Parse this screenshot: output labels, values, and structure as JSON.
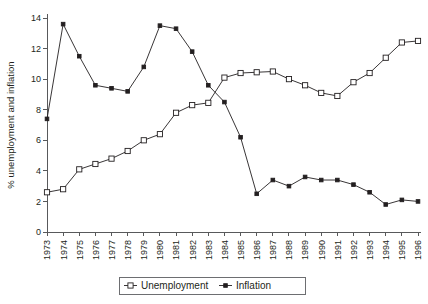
{
  "chart_data": {
    "type": "line",
    "title": "",
    "xlabel": "",
    "ylabel": "% unemployment and inflation",
    "xlim": [
      1973,
      1996
    ],
    "ylim": [
      0,
      14
    ],
    "ytick_step": 2,
    "grid": false,
    "legend_position": "bottom-center",
    "legend_entries": [
      "Unemployment",
      "Inflation"
    ],
    "categories": [
      "1973",
      "1974",
      "1975",
      "1976",
      "1977",
      "1978",
      "1979",
      "1980",
      "1981",
      "1982",
      "1983",
      "1984",
      "1985",
      "1986",
      "1987",
      "1988",
      "1989",
      "1990",
      "1991",
      "1992",
      "1993",
      "1994",
      "1995",
      "1996"
    ],
    "yticks": [
      "0",
      "2",
      "4",
      "6",
      "8",
      "10",
      "12",
      "14"
    ],
    "series": [
      {
        "name": "Unemployment",
        "marker": "open-square",
        "values": [
          2.6,
          2.8,
          4.1,
          4.45,
          4.8,
          5.3,
          6.0,
          6.4,
          7.8,
          8.3,
          8.45,
          10.1,
          10.4,
          10.45,
          10.5,
          10.0,
          9.6,
          9.1,
          8.9,
          9.8,
          10.4,
          11.4,
          12.4,
          12.5
        ]
      },
      {
        "name": "Inflation",
        "marker": "filled-square",
        "values": [
          7.4,
          13.6,
          11.5,
          9.6,
          9.4,
          9.2,
          10.8,
          13.5,
          13.3,
          11.8,
          9.6,
          8.5,
          6.2,
          2.5,
          3.4,
          3.0,
          3.6,
          3.4,
          3.4,
          3.1,
          2.6,
          1.8,
          2.1,
          2.0
        ]
      }
    ]
  }
}
